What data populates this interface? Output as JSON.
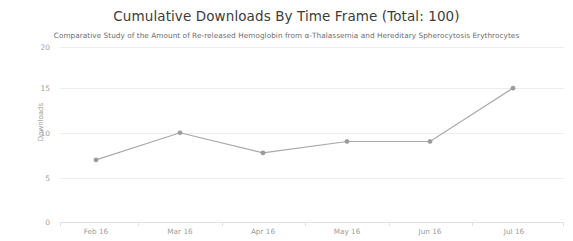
{
  "chart_data": {
    "type": "line",
    "title": "Cumulative Downloads By Time Frame (Total: 100)",
    "subtitle": "Comparative Study of the Amount of Re-released Hemoglobin from α-Thalassemia and Hereditary Spherocytosis Erythrocytes",
    "xlabel": "",
    "ylabel": "Downloads",
    "categories": [
      "Feb 16",
      "Mar 16",
      "Apr 16",
      "May 16",
      "Jun 16",
      "Jul 16"
    ],
    "values": [
      7.1,
      10.2,
      7.9,
      9.2,
      9.2,
      15.3
    ],
    "series": [
      {
        "name": "Downloads",
        "values": [
          7.1,
          10.2,
          7.9,
          9.2,
          9.2,
          15.3
        ]
      }
    ],
    "ylim": [
      0,
      20
    ],
    "y_ticks": [
      0,
      5,
      10,
      15,
      20
    ],
    "y_tick_labels": [
      "0",
      "5",
      "10",
      "15",
      "20"
    ],
    "grid": true,
    "grid_axis": "y",
    "legend": false,
    "legend_position": "none",
    "line_color": "#a8a8a8",
    "marker_color": "#9b9b9b",
    "marker_shape": "circle",
    "background_color": "#ffffff",
    "gridline_color": "#ececec",
    "axis_text_color": "#9d9d9d",
    "title_color": "#3c3c3c",
    "subtitle_color": "#6e6e6e"
  },
  "axis": {
    "y_title": "Downloads",
    "y_tick_0": "0",
    "y_tick_1": "5",
    "y_tick_2": "10",
    "y_tick_3": "15",
    "y_tick_4": "20",
    "x_tick_0": "Feb 16",
    "x_tick_1": "Mar 16",
    "x_tick_2": "Apr 16",
    "x_tick_3": "May 16",
    "x_tick_4": "Jun 16",
    "x_tick_5": "Jul 16"
  },
  "header": {
    "title": "Cumulative Downloads By Time Frame (Total: 100)",
    "subtitle": "Comparative Study of the Amount of Re-released Hemoglobin from α-Thalassemia and Hereditary Spherocytosis Erythrocytes"
  }
}
